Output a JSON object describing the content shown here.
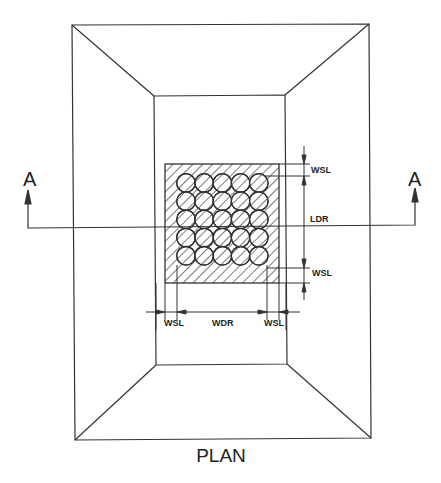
{
  "title": "PLAN",
  "section_marks": {
    "left": "A",
    "right": "A"
  },
  "dimensions": {
    "right_top": "WSL",
    "right_middle": "LDR",
    "right_bottom": "WSL",
    "bottom_left": "WSL",
    "bottom_middle": "WDR",
    "bottom_right": "WSL"
  },
  "grid": {
    "rows": 5,
    "cols": 5
  },
  "colors": {
    "line": "#333333",
    "background": "#ffffff"
  }
}
